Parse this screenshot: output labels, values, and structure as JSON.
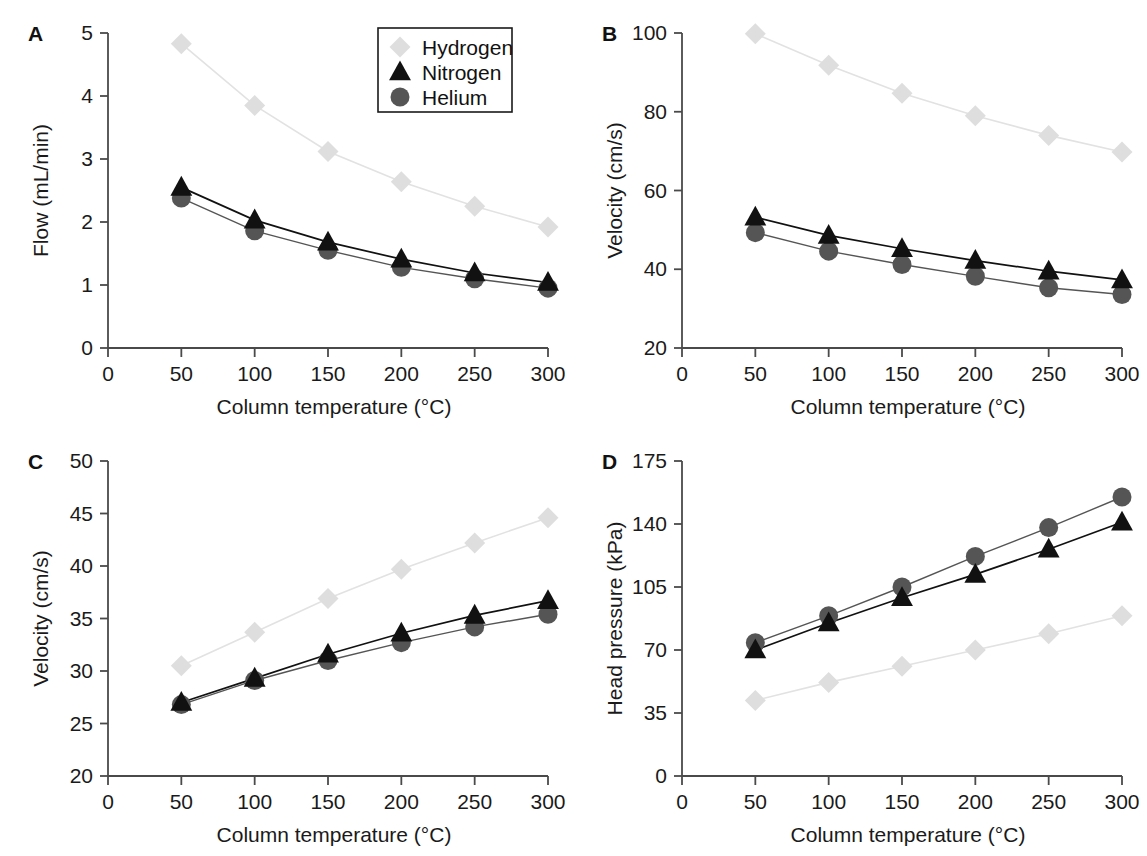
{
  "figure": {
    "legend": {
      "entries": [
        {
          "label": "Hydrogen",
          "marker": "diamond",
          "color": "#dedede"
        },
        {
          "label": "Nitrogen",
          "marker": "triangle",
          "color": "#111111"
        },
        {
          "label": "Helium",
          "marker": "circle",
          "color": "#555555"
        }
      ]
    },
    "shared_xlabel": "Column temperature (°C)",
    "x_tick_labels": [
      "0",
      "50",
      "100",
      "150",
      "200",
      "250",
      "300"
    ]
  },
  "chart_data": [
    {
      "panel": "A",
      "type": "line",
      "title": "",
      "xlabel": "Column temperature (°C)",
      "ylabel": "Flow (mL/min)",
      "x": [
        50,
        100,
        150,
        200,
        250,
        300
      ],
      "xlim": [
        0,
        300
      ],
      "ylim": [
        0,
        5
      ],
      "xticks": [
        0,
        50,
        100,
        150,
        200,
        250,
        300
      ],
      "yticks": [
        0,
        1,
        2,
        3,
        4,
        5
      ],
      "ytick_labels": [
        "0",
        "1",
        "2",
        "3",
        "4",
        "5"
      ],
      "grid": false,
      "legend_position": "top-center",
      "series": [
        {
          "name": "Hydrogen",
          "marker": "diamond",
          "color": "#dedede",
          "values": [
            4.83,
            3.85,
            3.12,
            2.64,
            2.25,
            1.92
          ]
        },
        {
          "name": "Nitrogen",
          "marker": "triangle",
          "color": "#111111",
          "values": [
            2.55,
            2.03,
            1.68,
            1.41,
            1.19,
            1.04
          ]
        },
        {
          "name": "Helium",
          "marker": "circle",
          "color": "#555555",
          "values": [
            2.38,
            1.86,
            1.55,
            1.28,
            1.1,
            0.95
          ]
        }
      ]
    },
    {
      "panel": "B",
      "type": "line",
      "title": "",
      "xlabel": "Column temperature (°C)",
      "ylabel": "Velocity (cm/s)",
      "x": [
        50,
        100,
        150,
        200,
        250,
        300
      ],
      "xlim": [
        0,
        300
      ],
      "ylim": [
        20,
        100
      ],
      "xticks": [
        0,
        50,
        100,
        150,
        200,
        250,
        300
      ],
      "yticks": [
        20,
        40,
        60,
        80,
        100
      ],
      "ytick_labels": [
        "20",
        "40",
        "60",
        "80",
        "100"
      ],
      "grid": false,
      "legend_position": "none",
      "series": [
        {
          "name": "Hydrogen",
          "marker": "diamond",
          "color": "#dedede",
          "values": [
            99.8,
            91.8,
            84.7,
            79.0,
            74.0,
            69.8
          ]
        },
        {
          "name": "Nitrogen",
          "marker": "triangle",
          "color": "#111111",
          "values": [
            53.2,
            48.6,
            45.2,
            42.2,
            39.5,
            37.3
          ]
        },
        {
          "name": "Helium",
          "marker": "circle",
          "color": "#555555",
          "values": [
            49.3,
            44.6,
            41.2,
            38.2,
            35.3,
            33.6
          ]
        }
      ]
    },
    {
      "panel": "C",
      "type": "line",
      "title": "",
      "xlabel": "Column temperature (°C)",
      "ylabel": "Velocity (cm/s)",
      "x": [
        50,
        100,
        150,
        200,
        250,
        300
      ],
      "xlim": [
        0,
        300
      ],
      "ylim": [
        20,
        50
      ],
      "xticks": [
        0,
        50,
        100,
        150,
        200,
        250,
        300
      ],
      "yticks": [
        20,
        25,
        30,
        35,
        40,
        45,
        50
      ],
      "ytick_labels": [
        "20",
        "25",
        "30",
        "35",
        "40",
        "45",
        "50"
      ],
      "grid": false,
      "legend_position": "none",
      "series": [
        {
          "name": "Hydrogen",
          "marker": "diamond",
          "color": "#dedede",
          "values": [
            30.5,
            33.7,
            36.9,
            39.7,
            42.2,
            44.6
          ]
        },
        {
          "name": "Nitrogen",
          "marker": "triangle",
          "color": "#111111",
          "values": [
            27.0,
            29.3,
            31.6,
            33.6,
            35.3,
            36.7
          ]
        },
        {
          "name": "Helium",
          "marker": "circle",
          "color": "#555555",
          "values": [
            26.8,
            29.1,
            31.0,
            32.7,
            34.2,
            35.4
          ]
        }
      ]
    },
    {
      "panel": "D",
      "type": "line",
      "title": "",
      "xlabel": "Column temperature (°C)",
      "ylabel": "Head pressure (kPa)",
      "x": [
        50,
        100,
        150,
        200,
        250,
        300
      ],
      "xlim": [
        0,
        300
      ],
      "ylim": [
        0,
        175
      ],
      "xticks": [
        0,
        50,
        100,
        150,
        200,
        250,
        300
      ],
      "yticks": [
        0,
        35,
        70,
        105,
        140,
        175
      ],
      "ytick_labels": [
        "0",
        "35",
        "70",
        "105",
        "140",
        "175"
      ],
      "grid": false,
      "legend_position": "none",
      "series": [
        {
          "name": "Hydrogen",
          "marker": "diamond",
          "color": "#dedede",
          "values": [
            42,
            52,
            61,
            70,
            79,
            89
          ]
        },
        {
          "name": "Nitrogen",
          "marker": "triangle",
          "color": "#111111",
          "values": [
            70,
            85,
            99,
            112,
            126,
            141
          ]
        },
        {
          "name": "Helium",
          "marker": "circle",
          "color": "#555555",
          "values": [
            74,
            89,
            105,
            122,
            138,
            155
          ]
        }
      ]
    }
  ]
}
